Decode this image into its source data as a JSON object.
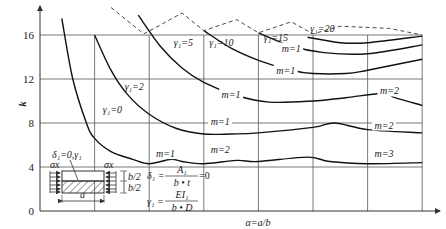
{
  "chart_data": {
    "type": "line",
    "title": "",
    "xlabel": "α=a/b",
    "ylabel": "k",
    "ylim": [
      0,
      18
    ],
    "yticks": [
      0,
      4,
      8,
      12,
      16
    ],
    "grid": true,
    "vertical_gridlines_alpha": [
      1,
      2,
      3,
      4,
      5,
      6,
      7
    ],
    "series": [
      {
        "name": "γ1=0",
        "label": "γ₁=0",
        "points": [
          [
            0.4,
            17.5
          ],
          [
            0.6,
            12
          ],
          [
            0.85,
            8
          ],
          [
            1.0,
            6.6
          ],
          [
            1.3,
            5.4
          ],
          [
            1.7,
            4.7
          ],
          [
            2.0,
            4.3
          ],
          [
            2.4,
            4.7
          ],
          [
            2.6,
            4.5
          ],
          [
            3.0,
            4.3
          ],
          [
            3.6,
            4.6
          ],
          [
            4.0,
            4.5
          ],
          [
            4.9,
            4.9
          ],
          [
            5.3,
            4.5
          ],
          [
            6.0,
            4.3
          ],
          [
            7.0,
            4.4
          ]
        ],
        "mode_labels": [
          "m=1",
          "m=2",
          "m=3"
        ]
      },
      {
        "name": "γ1=2",
        "label": "γ₁=2",
        "points": [
          [
            1.0,
            16
          ],
          [
            1.3,
            12.8
          ],
          [
            1.6,
            10.6
          ],
          [
            2.0,
            8.8
          ],
          [
            2.5,
            7.5
          ],
          [
            3.0,
            7.0
          ],
          [
            3.5,
            7.0
          ],
          [
            4.0,
            7.1
          ],
          [
            5.0,
            7.6
          ],
          [
            5.4,
            8.0
          ],
          [
            6.0,
            7.4
          ],
          [
            7.0,
            7.1
          ]
        ],
        "mode_labels": [
          "m=1",
          "m=2"
        ]
      },
      {
        "name": "γ1=5",
        "label": "γ₁=5",
        "points": [
          [
            1.8,
            17.8
          ],
          [
            2.2,
            15
          ],
          [
            2.6,
            13
          ],
          [
            3.0,
            11.7
          ],
          [
            3.6,
            10.5
          ],
          [
            4.2,
            9.9
          ],
          [
            5.0,
            10.0
          ],
          [
            5.6,
            10.3
          ],
          [
            6.3,
            10.7
          ],
          [
            6.5,
            10.3
          ],
          [
            7.0,
            9.6
          ]
        ],
        "mode_labels": [
          "m=1",
          "m=2"
        ]
      },
      {
        "name": "γ1=10",
        "label": "γ₁=10",
        "points": [
          [
            3.0,
            16.4
          ],
          [
            3.5,
            14.8
          ],
          [
            4.0,
            13.7
          ],
          [
            4.6,
            12.8
          ],
          [
            5.0,
            12.5
          ],
          [
            5.6,
            12.5
          ],
          [
            6.0,
            12.8
          ],
          [
            7.0,
            13.8
          ]
        ],
        "mode_labels": [
          "m=1"
        ]
      },
      {
        "name": "γ1=15",
        "label": "γ₁=15",
        "points": [
          [
            4.0,
            16.2
          ],
          [
            4.6,
            15.0
          ],
          [
            5.2,
            14.4
          ],
          [
            6.0,
            14.3
          ],
          [
            7.0,
            15.1
          ]
        ],
        "mode_labels": [
          "m=1"
        ]
      },
      {
        "name": "γ1=20",
        "label": "γ₁=20",
        "points": [
          [
            4.9,
            15.8
          ],
          [
            5.5,
            15.3
          ],
          [
            6.0,
            15.3
          ],
          [
            7.0,
            15.9
          ]
        ],
        "mode_labels": []
      }
    ],
    "envelope_dashed": {
      "description": "upper dashed envelope",
      "points": [
        [
          1.3,
          18.5
        ],
        [
          1.9,
          16.1
        ],
        [
          2.2,
          16.9
        ],
        [
          2.6,
          18.0
        ],
        [
          3.0,
          16.4
        ],
        [
          3.6,
          17.4
        ],
        [
          4.0,
          16.2
        ],
        [
          4.6,
          17.2
        ],
        [
          5.0,
          16.1
        ],
        [
          5.5,
          16.8
        ],
        [
          6.4,
          16.6
        ],
        [
          7.0,
          16.0
        ]
      ]
    },
    "annotations": {
      "m_labels": [
        {
          "text": "m=1",
          "alpha": 4.6,
          "k": 14.5
        },
        {
          "text": "m=1",
          "alpha": 4.5,
          "k": 12.5
        },
        {
          "text": "m=1",
          "alpha": 3.5,
          "k": 10.3
        },
        {
          "text": "m=2",
          "alpha": 6.4,
          "k": 10.6
        },
        {
          "text": "m=1",
          "alpha": 3.3,
          "k": 7.8
        },
        {
          "text": "m=2",
          "alpha": 6.3,
          "k": 7.5
        },
        {
          "text": "m=1",
          "alpha": 2.3,
          "k": 4.9
        },
        {
          "text": "m=2",
          "alpha": 3.3,
          "k": 5.3
        },
        {
          "text": "m=3",
          "alpha": 6.3,
          "k": 4.9
        }
      ],
      "inset": {
        "delta_label": "δ₁=0,γ₁",
        "sigma_left": "σx",
        "sigma_right": "σx",
        "b_half_top": "b/2",
        "b_half_bottom": "b/2",
        "a_label": "a",
        "formula_delta_lhs": "δ₁ =",
        "formula_delta_num": "A₁",
        "formula_delta_den": "b • t",
        "formula_delta_rhs": "=0",
        "formula_gamma_lhs": "γ₁ =",
        "formula_gamma_num": "EI₁",
        "formula_gamma_den": "b • D"
      }
    }
  }
}
